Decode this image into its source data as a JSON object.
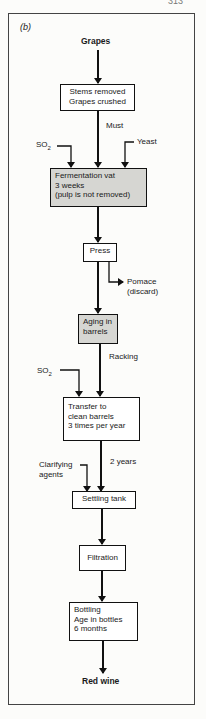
{
  "page_number": "313",
  "figure_label": "(b)",
  "colors": {
    "process_box": "#ffffff",
    "highlight_box": "#d6d6d2",
    "line": "#111111"
  },
  "nodes": {
    "start": "Grapes",
    "crush": {
      "line1": "Stems removed",
      "line2": "Grapes crushed"
    },
    "ferment": {
      "line1": "Fermentation vat",
      "line2": "3 weeks",
      "line3": "(pulp is not removed)"
    },
    "press": "Press",
    "aging": {
      "line1": "Aging in",
      "line2": "barrels"
    },
    "transfer": {
      "line1": "Transfer to",
      "line2": "clean barrels",
      "line3": "3 times per year"
    },
    "settling": "Settling tank",
    "filtration": "Filtration",
    "bottling": {
      "line1": "Bottling",
      "line2": "Age in bottles",
      "line3": "6 months"
    },
    "end": "Red wine"
  },
  "edge_labels": {
    "must": "Must",
    "so2_1": "SO",
    "so2_1_sub": "2",
    "yeast": "Yeast",
    "pomace": {
      "line1": "Pomace",
      "line2": "(discard)"
    },
    "racking": "Racking",
    "so2_2": "SO",
    "so2_2_sub": "2",
    "two_years": "2 years",
    "clarifying": {
      "line1": "Clarifying",
      "line2": "agents"
    }
  }
}
